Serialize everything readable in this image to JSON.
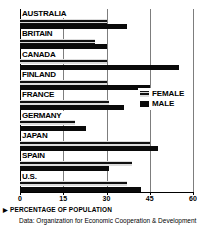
{
  "title": "",
  "legend": {
    "position": "right-middle",
    "items": [
      {
        "label": "FEMALE",
        "swatch": "hatched-dark"
      },
      {
        "label": "MALE",
        "swatch": "solid-black"
      }
    ]
  },
  "axis": {
    "label": "PERCENTAGE OF POPULATION",
    "arrow_icon": "▶",
    "ticks": [
      "0",
      "15",
      "30",
      "45",
      "60"
    ]
  },
  "source": "Data: Organization for Economic Cooperation & Development",
  "chart_data": {
    "type": "bar",
    "orientation": "horizontal",
    "title": "",
    "xlabel": "PERCENTAGE OF POPULATION",
    "ylabel": "",
    "xlim": [
      0,
      60
    ],
    "xticks": [
      0,
      15,
      30,
      45,
      60
    ],
    "grid": true,
    "legend_position": "right-middle",
    "categories": [
      "AUSTRALIA",
      "BRITAIN",
      "CANADA",
      "FINLAND",
      "FRANCE",
      "GERMANY",
      "JAPAN",
      "SPAIN",
      "U.S."
    ],
    "series": [
      {
        "name": "FEMALE",
        "values": [
          30,
          26,
          30,
          30,
          31,
          19,
          45,
          39,
          37
        ]
      },
      {
        "name": "MALE",
        "values": [
          37,
          30,
          55,
          45,
          36,
          23,
          48,
          31,
          42
        ]
      }
    ]
  }
}
